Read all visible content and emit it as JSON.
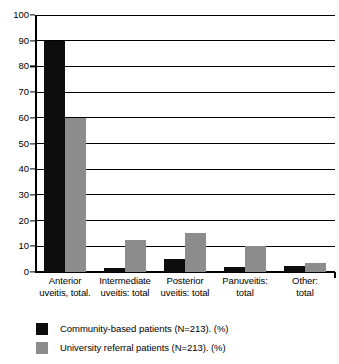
{
  "chart_data": {
    "type": "bar",
    "title": "",
    "xlabel": "",
    "ylabel": "",
    "ylim": [
      0,
      100
    ],
    "yticks": [
      0,
      10,
      20,
      30,
      40,
      50,
      60,
      70,
      80,
      90,
      100
    ],
    "grid": true,
    "legend_position": "bottom-left",
    "categories": [
      {
        "line1": "Anterior",
        "line2": "uveitis, total."
      },
      {
        "line1": "Intermediate",
        "line2": "uveitis: total"
      },
      {
        "line1": "Posterior",
        "line2": "uveitis: total"
      },
      {
        "line1": "Panuveitis:",
        "line2": "total"
      },
      {
        "line1": "Other:",
        "line2": "total"
      }
    ],
    "series": [
      {
        "name": "Community-based patients (N=213). (%)",
        "color": "#0d0d0d",
        "values": [
          90,
          1.5,
          5,
          2,
          2.5
        ]
      },
      {
        "name": "University referral patients (N=213). (%)",
        "color": "#8c8c8c",
        "values": [
          60,
          12.5,
          15,
          10,
          3.5
        ]
      }
    ]
  },
  "legend": {
    "items": [
      {
        "label": "Community-based patients (N=213). (%)"
      },
      {
        "label": "University referral patients (N=213). (%)"
      }
    ]
  }
}
